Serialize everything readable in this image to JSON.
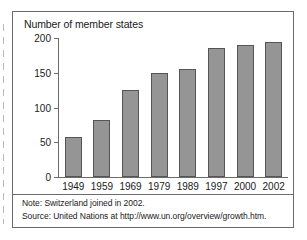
{
  "chart_data": {
    "type": "bar",
    "title": "Number of member states",
    "xlabel": "",
    "ylabel": "",
    "categories": [
      "1949",
      "1959",
      "1969",
      "1979",
      "1989",
      "1997",
      "2000",
      "2002"
    ],
    "values": [
      58,
      82,
      125,
      149,
      156,
      185,
      190,
      194
    ],
    "yticks": [
      "0",
      "50",
      "100",
      "150",
      "200"
    ],
    "ytick_values": [
      0,
      50,
      100,
      150,
      200
    ],
    "ylim": [
      0,
      200
    ],
    "grid": false,
    "legend": "none",
    "bar_color": "#959595",
    "bar_border_color": "#555555",
    "axis_color": "#6b6b6b",
    "text_color": "#1a1a1a"
  },
  "notes": {
    "note": "Note:  Switzerland joined in 2002.",
    "source": "Source:  United Nations at http://www.un.org/overview/growth.htm."
  }
}
